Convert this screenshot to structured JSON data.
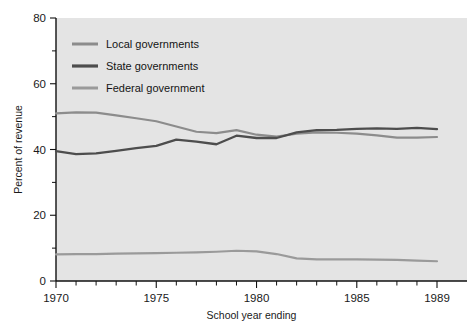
{
  "chart_data": {
    "type": "line",
    "title": "",
    "xlabel": "School year ending",
    "ylabel": "Percent of revenue",
    "xlim": [
      1970,
      1989
    ],
    "ylim": [
      0,
      80
    ],
    "grid": false,
    "legend_position": "top-left inside plot",
    "x": [
      1970,
      1971,
      1972,
      1973,
      1974,
      1975,
      1976,
      1977,
      1978,
      1979,
      1980,
      1981,
      1982,
      1983,
      1984,
      1985,
      1986,
      1987,
      1988,
      1989
    ],
    "x_tick_labels": [
      "1970",
      "1975",
      "1980",
      "1985",
      "1989"
    ],
    "x_tick_values": [
      1970,
      1975,
      1980,
      1985,
      1989
    ],
    "y_tick_labels": [
      "0",
      "20",
      "40",
      "60",
      "80"
    ],
    "y_tick_values": [
      0,
      20,
      40,
      60,
      80
    ],
    "y_minor_tick_values": [
      10,
      30,
      50,
      70
    ],
    "series": [
      {
        "name": "Local governments",
        "color": "#8c8c8c",
        "values": [
          51.0,
          51.3,
          51.2,
          50.4,
          49.5,
          48.6,
          47.0,
          45.4,
          45.0,
          45.9,
          44.5,
          43.9,
          44.8,
          45.2,
          45.1,
          44.8,
          44.3,
          43.6,
          43.6,
          43.8
        ]
      },
      {
        "name": "State governments",
        "color": "#4d4d4d",
        "values": [
          39.5,
          38.6,
          38.8,
          39.6,
          40.4,
          41.1,
          43.0,
          42.4,
          41.6,
          44.2,
          43.5,
          43.5,
          45.2,
          45.9,
          46.0,
          46.3,
          46.4,
          46.3,
          46.6,
          46.2
        ]
      },
      {
        "name": "Federal government",
        "color": "#9a9a9a",
        "values": [
          8.1,
          8.2,
          8.2,
          8.3,
          8.4,
          8.5,
          8.6,
          8.7,
          8.9,
          9.2,
          9.0,
          8.2,
          6.9,
          6.6,
          6.6,
          6.6,
          6.5,
          6.4,
          6.2,
          6.0
        ]
      }
    ]
  },
  "legend": {
    "items": [
      {
        "label": "Local governments"
      },
      {
        "label": "State governments"
      },
      {
        "label": "Federal government"
      }
    ]
  },
  "axes": {
    "x_label": "School year ending",
    "y_label": "Percent of revenue"
  }
}
